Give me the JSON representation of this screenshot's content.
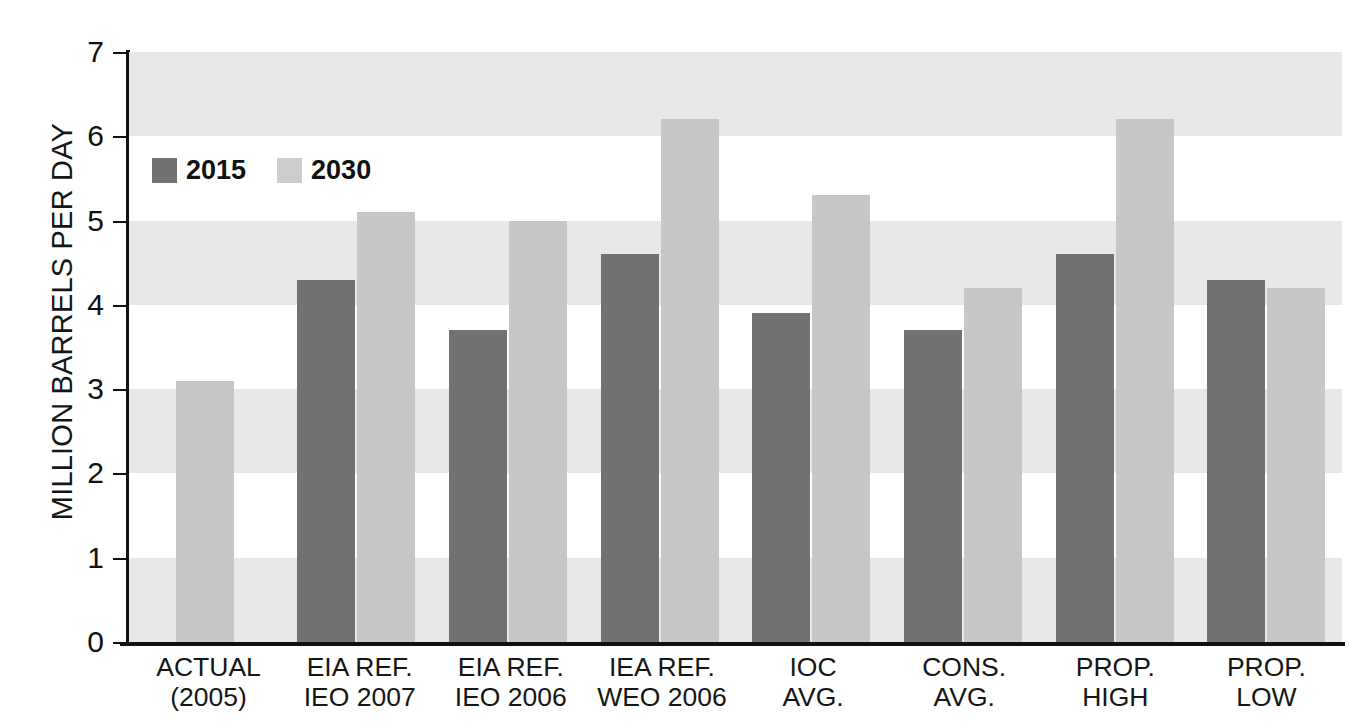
{
  "chart_data": {
    "type": "bar",
    "title": "",
    "xlabel": "",
    "ylabel": "MILLION BARRELS PER DAY",
    "ylim": [
      0,
      7
    ],
    "yticks": [
      "0",
      "1",
      "2",
      "3",
      "4",
      "5",
      "6",
      "7"
    ],
    "grid": "alternating horizontal bands",
    "legend_position": "upper-left-inside",
    "categories": [
      {
        "line1": "ACTUAL",
        "line2": "(2005)"
      },
      {
        "line1": "EIA REF.",
        "line2": "IEO 2007"
      },
      {
        "line1": "EIA REF.",
        "line2": "IEO 2006"
      },
      {
        "line1": "IEA REF.",
        "line2": "WEO 2006"
      },
      {
        "line1": "IOC",
        "line2": "AVG."
      },
      {
        "line1": "CONS.",
        "line2": "AVG."
      },
      {
        "line1": "PROP.",
        "line2": "HIGH"
      },
      {
        "line1": "PROP.",
        "line2": "LOW"
      }
    ],
    "series": [
      {
        "name": "2015",
        "color": "#727272",
        "values": [
          null,
          4.3,
          3.7,
          4.6,
          3.9,
          3.7,
          4.6,
          4.3
        ]
      },
      {
        "name": "2030",
        "color": "#c7c7c7",
        "values": [
          3.1,
          5.1,
          5.0,
          6.2,
          5.3,
          4.2,
          6.2,
          4.2
        ]
      }
    ]
  },
  "legend": {
    "items": [
      {
        "label": "2015",
        "series": "s2015"
      },
      {
        "label": "2030",
        "series": "s2030"
      }
    ]
  },
  "colors": {
    "series_2015": "#727272",
    "series_2030": "#c7c7c7",
    "band": "#e8e8e8",
    "axis": "#111111",
    "text": "#161616",
    "background": "#ffffff"
  }
}
